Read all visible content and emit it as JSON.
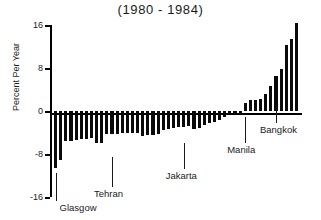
{
  "chart_data": {
    "type": "bar",
    "title": "(1980 - 1984)",
    "xlabel": "",
    "ylabel": "Percent Per Year",
    "ylim": [
      -16,
      16
    ],
    "yticks": [
      16,
      8,
      0,
      -8,
      -16
    ],
    "ytick_labels": [
      "16",
      "8",
      "0",
      "-8",
      "-16"
    ],
    "grid": false,
    "legend": false,
    "bar_color": "#0a0a0a",
    "background_color": "#ffffff",
    "categories": [
      "b1",
      "b2",
      "b3",
      "b4",
      "b5",
      "b6",
      "b7",
      "b8",
      "b9",
      "b10",
      "b11",
      "b12",
      "b13",
      "b14",
      "b15",
      "b16",
      "b17",
      "b18",
      "b19",
      "b20",
      "b21",
      "b22",
      "b23",
      "b24",
      "b25",
      "b26",
      "b27",
      "b28",
      "b29",
      "b30",
      "b31",
      "b32",
      "b33",
      "b34",
      "b35",
      "b36",
      "b37",
      "b38",
      "b39",
      "b40",
      "b41",
      "b42",
      "b43",
      "b44"
    ],
    "values": [
      -10.6,
      -9.2,
      -5.6,
      -5.5,
      -5.4,
      -5.3,
      -5.2,
      -5.1,
      -5.9,
      -6.0,
      -4.3,
      -4.2,
      -4.2,
      -4.1,
      -4.1,
      -4.0,
      -4.0,
      -4.6,
      -4.5,
      -4.4,
      -4.3,
      -3.6,
      -3.4,
      -3.2,
      -3.0,
      -2.9,
      -2.8,
      -3.3,
      -3.1,
      -2.6,
      -2.2,
      -2.0,
      -1.7,
      -1.2,
      -0.6,
      -0.5,
      -0.7,
      1.4,
      2.0,
      2.1,
      2.2,
      3.1,
      4.6,
      6.6
    ],
    "extra_values": [
      7.9,
      12.3,
      13.4,
      16.4
    ],
    "annotations": [
      {
        "label": "Glasgow",
        "bar_index": 0
      },
      {
        "label": "Tehran",
        "bar_index": 11
      },
      {
        "label": "Jakarta",
        "bar_index": 25
      },
      {
        "label": "Manila",
        "bar_index": 37
      },
      {
        "label": "Bangkok",
        "bar_index": 43
      }
    ]
  },
  "annotation_labels": {
    "glasgow": "Glasgow",
    "tehran": "Tehran",
    "jakarta": "Jakarta",
    "manila": "Manila",
    "bangkok": "Bangkok"
  }
}
